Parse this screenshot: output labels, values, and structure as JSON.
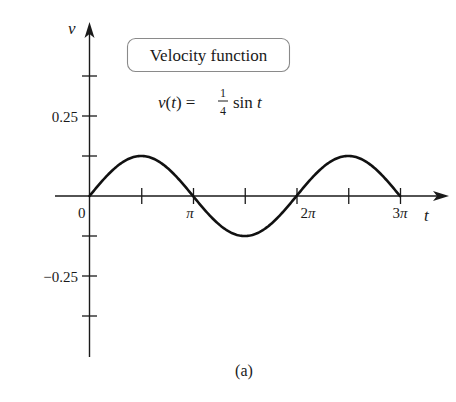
{
  "chart_data": {
    "type": "line",
    "title": "Velocity function",
    "formula": {
      "lhs": "v(t) = ",
      "frac_num": "1",
      "frac_den": "4",
      "rhs": "sin t"
    },
    "caption": "(a)",
    "xlabel": "t",
    "ylabel": "v",
    "xlim": [
      0,
      9.42478
    ],
    "ylim": [
      -0.5,
      0.5
    ],
    "x_ticks": [
      {
        "value": 0,
        "label": "0"
      },
      {
        "value": 1.5708,
        "label": ""
      },
      {
        "value": 3.14159,
        "label": "π"
      },
      {
        "value": 4.71239,
        "label": ""
      },
      {
        "value": 6.28319,
        "label": "2π"
      },
      {
        "value": 7.85398,
        "label": ""
      },
      {
        "value": 9.42478,
        "label": "3π"
      }
    ],
    "y_ticks": [
      {
        "value": 0.375,
        "label": ""
      },
      {
        "value": 0.25,
        "label": "0.25"
      },
      {
        "value": 0.125,
        "label": ""
      },
      {
        "value": -0.125,
        "label": ""
      },
      {
        "value": -0.25,
        "label": "−0.25"
      },
      {
        "value": -0.375,
        "label": ""
      }
    ],
    "grid": false,
    "series": [
      {
        "name": "v(t) = (1/4) sin t",
        "color": "#111111",
        "x": [
          0,
          0.7854,
          1.5708,
          2.3562,
          3.1416,
          3.927,
          4.7124,
          5.4978,
          6.2832,
          7.0686,
          7.854,
          8.6394,
          9.4248
        ],
        "values": [
          0,
          0.1768,
          0.25,
          0.1768,
          0,
          -0.1768,
          -0.25,
          -0.1768,
          0,
          0.1768,
          0.25,
          0.1768,
          0
        ]
      }
    ]
  },
  "labels": {
    "title_box": "Velocity function",
    "y_axis": "v",
    "x_axis": "t",
    "origin": "0",
    "pi": "π",
    "two_pi": "2π",
    "three_pi": "3π",
    "y_pos": "0.25",
    "y_neg": "−0.25",
    "formula_lhs": "v(t) = ",
    "formula_num": "1",
    "formula_den": "4",
    "formula_rhs_sin": "sin ",
    "formula_rhs_t": "t",
    "caption": "(a)"
  }
}
